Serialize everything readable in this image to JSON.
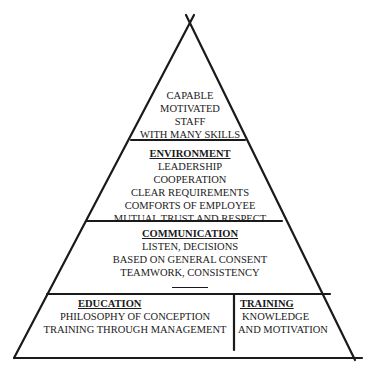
{
  "diagram": {
    "type": "pyramid",
    "apex": {
      "lines": [
        "CAPABLE",
        "MOTIVATED",
        "STAFF",
        "WITH MANY SKILLS"
      ]
    },
    "environment": {
      "title": "ENVIRONMENT",
      "lines": [
        "LEADERSHIP",
        "COOPERATION",
        "CLEAR REQUIREMENTS",
        "COMFORTS OF EMPLOYEE",
        "MUTUAL TRUST AND RESPECT"
      ]
    },
    "communication": {
      "title": "COMMUNICATION",
      "lines": [
        "LISTEN, DECISIONS",
        "BASED ON GENERAL CONSENT",
        "TEAMWORK, CONSISTENCY"
      ]
    },
    "education": {
      "title": "EDUCATION",
      "lines": [
        "PHILOSOPHY OF CONCEPTION",
        "TRAINING THROUGH MANAGEMENT"
      ]
    },
    "training": {
      "title": "TRAINING",
      "lines": [
        "KNOWLEDGE",
        "AND MOTIVATION"
      ]
    },
    "colors": {
      "line": "#1a1a1a",
      "background": "#ffffff"
    }
  }
}
